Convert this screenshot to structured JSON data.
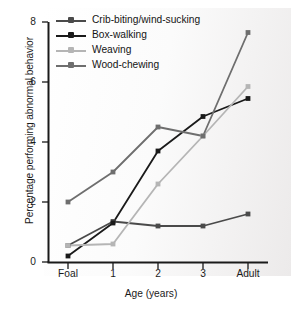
{
  "chart_data": {
    "type": "line",
    "title": "",
    "xlabel": "Age (years)",
    "ylabel": "Percentage performing abnormal behavior",
    "categories": [
      "Foal",
      "1",
      "2",
      "3",
      "Adult"
    ],
    "xticklabels": [
      "Foal",
      "1",
      "2",
      "3",
      "Adult"
    ],
    "yticklabels": [
      "0",
      "2",
      "4",
      "6",
      "8"
    ],
    "yticks": [
      0,
      2,
      4,
      6,
      8
    ],
    "ylim": [
      0,
      8
    ],
    "grid": false,
    "legend_position": "top-left",
    "series": [
      {
        "name": "Crib-biting/wind-sucking",
        "color": "#4a4a4a",
        "values": [
          0.55,
          1.35,
          1.2,
          1.2,
          1.6
        ]
      },
      {
        "name": "Box-walking",
        "color": "#1a1a1a",
        "values": [
          0.2,
          1.3,
          3.7,
          4.85,
          5.45
        ]
      },
      {
        "name": "Weaving",
        "color": "#b5b5b5",
        "values": [
          0.55,
          0.6,
          2.6,
          4.2,
          5.85
        ]
      },
      {
        "name": "Wood-chewing",
        "color": "#6e6e6e",
        "values": [
          2.0,
          3.0,
          4.5,
          4.2,
          7.65
        ]
      }
    ]
  },
  "axis": {
    "tick_0": "0",
    "tick_2": "2",
    "tick_4": "4",
    "tick_6": "6",
    "tick_8": "8",
    "x_0": "Foal",
    "x_1": "1",
    "x_2": "2",
    "x_3": "3",
    "x_4": "Adult",
    "axis_color": "#1a1a1a"
  },
  "legend": {
    "item_0": "Crib-biting/wind-sucking",
    "item_1": "Box-walking",
    "item_2": "Weaving",
    "item_3": "Wood-chewing"
  }
}
